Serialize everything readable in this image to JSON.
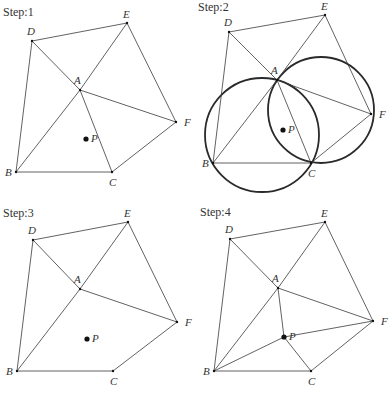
{
  "panels": [
    {
      "title": "Step:1",
      "offset": [
        0,
        0
      ],
      "points": {
        "A": [
          80,
          90
        ],
        "B": [
          16,
          172
        ],
        "C": [
          112,
          172
        ],
        "D": [
          32,
          41
        ],
        "E": [
          127,
          23
        ],
        "F": [
          176,
          122
        ],
        "P": [
          86,
          139
        ]
      },
      "edges": [
        [
          "D",
          "E"
        ],
        [
          "D",
          "B"
        ],
        [
          "D",
          "A"
        ],
        [
          "E",
          "A"
        ],
        [
          "E",
          "F"
        ],
        [
          "A",
          "B"
        ],
        [
          "A",
          "C"
        ],
        [
          "A",
          "F"
        ],
        [
          "B",
          "C"
        ],
        [
          "C",
          "F"
        ]
      ],
      "circles": []
    },
    {
      "title": "Step:2",
      "offset": [
        0,
        0
      ],
      "points": {
        "A": [
          277,
          80
        ],
        "B": [
          213,
          163
        ],
        "C": [
          311,
          163
        ],
        "D": [
          229,
          32
        ],
        "E": [
          325,
          15
        ],
        "F": [
          371,
          114
        ],
        "P": [
          283,
          130
        ]
      },
      "edges": [
        [
          "D",
          "E"
        ],
        [
          "D",
          "B"
        ],
        [
          "D",
          "A"
        ],
        [
          "E",
          "A"
        ],
        [
          "E",
          "F"
        ],
        [
          "A",
          "B"
        ],
        [
          "A",
          "C"
        ],
        [
          "A",
          "F"
        ],
        [
          "B",
          "C"
        ],
        [
          "C",
          "F"
        ]
      ],
      "circles": [
        {
          "cx": 262,
          "cy": 135,
          "r": 57
        },
        {
          "cx": 321,
          "cy": 110,
          "r": 53
        }
      ]
    },
    {
      "title": "Step:3",
      "offset": [
        0,
        0
      ],
      "points": {
        "A": [
          80,
          289
        ],
        "B": [
          17,
          371
        ],
        "C": [
          113,
          371
        ],
        "D": [
          33,
          240
        ],
        "E": [
          128,
          222
        ],
        "F": [
          177,
          322
        ],
        "P": [
          87,
          339
        ]
      },
      "edges": [
        [
          "D",
          "E"
        ],
        [
          "D",
          "B"
        ],
        [
          "D",
          "A"
        ],
        [
          "E",
          "A"
        ],
        [
          "E",
          "F"
        ],
        [
          "A",
          "B"
        ],
        [
          "A",
          "F"
        ],
        [
          "B",
          "C"
        ],
        [
          "C",
          "F"
        ]
      ],
      "circles": []
    },
    {
      "title": "Step:4",
      "offset": [
        0,
        0
      ],
      "points": {
        "A": [
          278,
          288
        ],
        "B": [
          214,
          371
        ],
        "C": [
          311,
          371
        ],
        "D": [
          230,
          239
        ],
        "E": [
          325,
          222
        ],
        "F": [
          373,
          321
        ],
        "P": [
          284,
          337
        ]
      },
      "edges": [
        [
          "D",
          "E"
        ],
        [
          "D",
          "B"
        ],
        [
          "D",
          "A"
        ],
        [
          "E",
          "A"
        ],
        [
          "E",
          "F"
        ],
        [
          "A",
          "B"
        ],
        [
          "A",
          "F"
        ],
        [
          "B",
          "C"
        ],
        [
          "C",
          "F"
        ],
        [
          "P",
          "A"
        ],
        [
          "P",
          "B"
        ],
        [
          "P",
          "C"
        ],
        [
          "P",
          "F"
        ]
      ],
      "circles": []
    }
  ],
  "titles": {
    "step1": "Step:1",
    "step2": "Step:2",
    "step3": "Step:3",
    "step4": "Step:4"
  },
  "labels": {
    "A": "A",
    "B": "B",
    "C": "C",
    "D": "D",
    "E": "E",
    "F": "F",
    "P": "P"
  }
}
